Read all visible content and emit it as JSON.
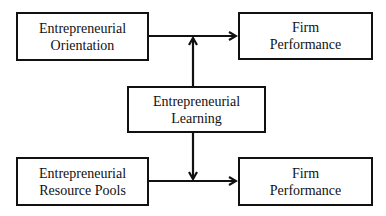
{
  "diagram": {
    "type": "conceptual-framework",
    "nodes": {
      "eo": {
        "line1": "Entrepreneurial",
        "line2": "Orientation"
      },
      "fp_top": {
        "line1": "Firm",
        "line2": "Performance"
      },
      "el": {
        "line1": "Entrepreneurial",
        "line2": "Learning"
      },
      "erp": {
        "line1": "Entrepreneurial",
        "line2": "Resource Pools"
      },
      "fp_bottom": {
        "line1": "Firm",
        "line2": "Performance"
      }
    },
    "edges": [
      {
        "from": "Entrepreneurial Orientation",
        "to": "Firm Performance (top)",
        "type": "direct"
      },
      {
        "from": "Entrepreneurial Learning",
        "to": "EO -> Firm Performance path",
        "type": "moderating"
      },
      {
        "from": "Entrepreneurial Resource Pools",
        "to": "Firm Performance (bottom)",
        "type": "direct"
      },
      {
        "from": "Entrepreneurial Learning",
        "to": "ERP -> Firm Performance path",
        "type": "moderating"
      }
    ],
    "colors": {
      "stroke": "#111111",
      "background": "#ffffff"
    }
  }
}
